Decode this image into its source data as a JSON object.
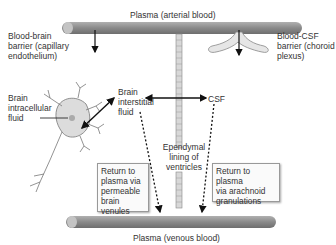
{
  "diagram": {
    "top_vessel_label": "Plasma (arterial blood)",
    "bottom_vessel_label": "Plasma (venous blood)",
    "bbb_label": [
      "Blood-brain",
      "barrier (capillary",
      "endothelium)"
    ],
    "bcsf_label": [
      "Blood-CSF",
      "barrier (choroid",
      "plexus)"
    ],
    "intracellular_label": [
      "Brain",
      "intracellular",
      "fluid"
    ],
    "interstitial_label": [
      "Brain",
      "interstitial",
      "fluid"
    ],
    "csf_label": "CSF",
    "ependymal_label": [
      "Ependymal",
      "lining of",
      "ventricles"
    ],
    "venules_box": [
      "Return to",
      "plasma via",
      "permeable",
      "brain venules"
    ],
    "arachnoid_box": [
      "Return to plasma",
      "via arachnoid",
      "granulations"
    ],
    "colors": {
      "vessel": "#8a8a8a",
      "vessel_dark": "#6e6e6e",
      "neuron": "#dcdcdc",
      "arrow": "#111111"
    }
  }
}
